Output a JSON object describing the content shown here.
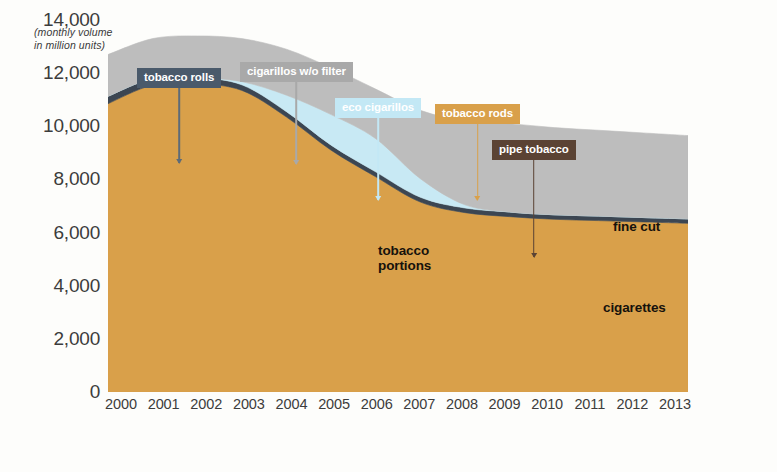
{
  "axis_caption": "(monthly volume\nin million units)",
  "chart_data": {
    "type": "area",
    "title": "",
    "subtitle": "",
    "xlabel": "",
    "ylabel": "(monthly volume in million units)",
    "ylim": [
      0,
      14000
    ],
    "yticks": [
      "14,000",
      "12,000",
      "10,000",
      "8,000",
      "6,000",
      "4,000",
      "2,000",
      "0"
    ],
    "ytick_values": [
      14000,
      12000,
      10000,
      8000,
      6000,
      4000,
      2000,
      0
    ],
    "grid": false,
    "legend_position": "annotated-callouts",
    "stacked": true,
    "x": [
      2000,
      2001,
      2002,
      2003,
      2004,
      2005,
      2006,
      2007,
      2008,
      2009,
      2010,
      2011,
      2012,
      2013
    ],
    "xticks": [
      "2000",
      "2001",
      "2002",
      "2003",
      "2004",
      "2005",
      "2006",
      "2007",
      "2008",
      "2009",
      "2010",
      "2011",
      "2012",
      "2013"
    ],
    "series": [
      {
        "name": "cigarettes",
        "color": "#d9a04a",
        "values": [
          10850,
          11550,
          11600,
          11350,
          10350,
          9100,
          8100,
          7150,
          6750,
          6600,
          6500,
          6450,
          6400,
          6350
        ]
      },
      {
        "name": "tobacco portions",
        "color": "#3c4652",
        "values": [
          280,
          250,
          230,
          210,
          200,
          190,
          185,
          180,
          175,
          175,
          170,
          170,
          165,
          165
        ]
      },
      {
        "name": "eco cigarillos",
        "color": "#c8e9f4",
        "values": [
          0,
          0,
          0,
          120,
          620,
          1150,
          1250,
          700,
          120,
          0,
          0,
          0,
          0,
          0
        ]
      },
      {
        "name": "fine cut",
        "color": "#bdbdbd",
        "values": [
          1570,
          1500,
          1570,
          1620,
          1730,
          1760,
          1865,
          2570,
          3155,
          3325,
          3280,
          3230,
          3185,
          3135
        ]
      }
    ],
    "totals": [
      12700,
      13300,
      13400,
      13300,
      12900,
      12200,
      11400,
      10600,
      10200,
      10100,
      9950,
      9850,
      9750,
      9650
    ],
    "inline_labels": [
      {
        "name": "tobacco portions",
        "text": "tobacco\nportions"
      },
      {
        "name": "fine cut",
        "text": "fine cut"
      },
      {
        "name": "cigarettes",
        "text": "cigarettes"
      }
    ],
    "callouts": [
      {
        "name": "tobacco rolls",
        "label": "tobacco rolls",
        "box_color": "#4a5a6b",
        "stem_color": "#5d6b78"
      },
      {
        "name": "cigarillos w/o filter",
        "label": "cigarillos w/o filter",
        "box_color": "#a9a9a9",
        "stem_color": "#a9a9a9"
      },
      {
        "name": "eco cigarillos",
        "label": "eco cigarillos",
        "box_color": "#c3e8f5",
        "stem_color": "#c3e8f5"
      },
      {
        "name": "tobacco rods",
        "label": "tobacco rods",
        "box_color": "#d9a04a",
        "stem_color": "#d9a04a"
      },
      {
        "name": "pipe tobacco",
        "label": "pipe tobacco",
        "box_color": "#5b4334",
        "stem_color": "#5b4334"
      }
    ]
  },
  "y_ticks": [
    {
      "label": "14,000"
    },
    {
      "label": "12,000"
    },
    {
      "label": "10,000"
    },
    {
      "label": "8,000"
    },
    {
      "label": "6,000"
    },
    {
      "label": "4,000"
    },
    {
      "label": "2,000"
    },
    {
      "label": "0"
    }
  ],
  "x_ticks": [
    {
      "label": "2000"
    },
    {
      "label": "2001"
    },
    {
      "label": "2002"
    },
    {
      "label": "2003"
    },
    {
      "label": "2004"
    },
    {
      "label": "2005"
    },
    {
      "label": "2006"
    },
    {
      "label": "2007"
    },
    {
      "label": "2008"
    },
    {
      "label": "2009"
    },
    {
      "label": "2010"
    },
    {
      "label": "2011"
    },
    {
      "label": "2012"
    },
    {
      "label": "2013"
    }
  ],
  "inline_labels": {
    "tobacco_portions": "tobacco\nportions",
    "fine_cut": "fine cut",
    "cigarettes": "cigarettes"
  },
  "callouts": {
    "tobacco_rolls": "tobacco rolls",
    "cigarillos_wo_filter": "cigarillos w/o filter",
    "eco_cigarillos": "eco cigarillos",
    "tobacco_rods": "tobacco rods",
    "pipe_tobacco": "pipe tobacco"
  }
}
